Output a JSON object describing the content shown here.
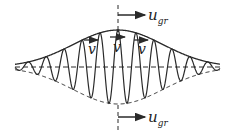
{
  "diagram": {
    "labels": {
      "group_velocity_top": {
        "main": "u",
        "sub": "gr"
      },
      "group_velocity_bottom": {
        "main": "u",
        "sub": "gr"
      },
      "phase_velocity": [
        "v",
        "v",
        "v"
      ]
    },
    "colors": {
      "stroke": "#2a2a2a",
      "background": "#ffffff"
    },
    "geometry": {
      "center_x": 118,
      "baseline_y": 67,
      "amplitude": 37,
      "sigma": 45,
      "x_start": 15,
      "x_end": 220,
      "wavelength": 18
    }
  }
}
